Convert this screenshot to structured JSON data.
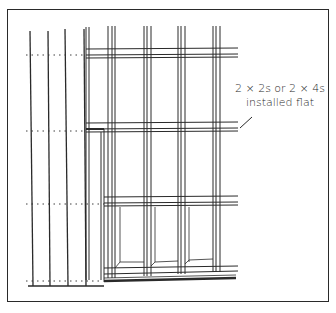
{
  "diagram": {
    "callout": {
      "line1": "2 × 2s or 2 × 4s",
      "line2": "installed flat"
    },
    "colors": {
      "ink": "#2a2a2a",
      "background": "#ffffff"
    }
  }
}
